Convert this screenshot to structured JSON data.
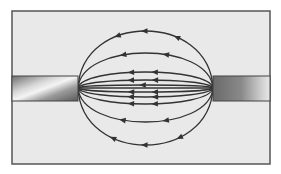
{
  "figure": {
    "frame": {
      "x": 12,
      "y": 11,
      "width": 258,
      "height": 153,
      "fill": "#e9e9e9",
      "stroke": "#555555"
    },
    "left_magnet": {
      "x": 12,
      "y": 76,
      "width": 66,
      "height": 25
    },
    "right_magnet": {
      "x": 213,
      "y": 76,
      "width": 57,
      "height": 25
    },
    "left_pole": {
      "x": 78,
      "y": 88
    },
    "right_pole": {
      "x": 213,
      "y": 88
    },
    "field_line_color": "#333333",
    "arrow_direction": "left",
    "field_lines": [
      {
        "apex_y": 31,
        "arrows_x": [
          118,
          145,
          177
        ]
      },
      {
        "apex_y": 53,
        "arrows_x": [
          123,
          166
        ]
      },
      {
        "apex_y": 72,
        "arrows_x": [
          131,
          155
        ]
      },
      {
        "apex_y": 80,
        "arrows_x": [
          131,
          155
        ]
      },
      {
        "apex_y": 85,
        "arrows_x": [
          143
        ]
      },
      {
        "apex_y": 88,
        "arrows_x": []
      },
      {
        "apex_y": 92,
        "arrows_x": [
          131,
          155
        ]
      },
      {
        "apex_y": 97,
        "arrows_x": [
          131,
          155
        ]
      },
      {
        "apex_y": 104,
        "arrows_x": [
          131,
          155
        ]
      },
      {
        "apex_y": 122,
        "arrows_x": [
          123,
          166
        ]
      },
      {
        "apex_y": 145,
        "arrows_x": [
          113,
          145,
          180
        ]
      }
    ]
  }
}
